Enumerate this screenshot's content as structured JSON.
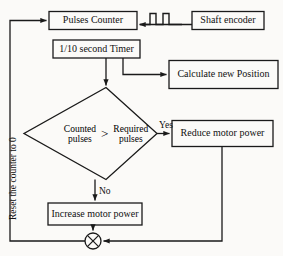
{
  "diagram": {
    "type": "flowchart",
    "stroke_color": "#1a1a1a",
    "background_color": "#fbfaf8",
    "text_color": "#111111"
  },
  "nodes": {
    "pulses_counter": {
      "label": "Pulses Counter",
      "shape": "rectangle"
    },
    "shaft_encoder": {
      "label": "Shaft encoder",
      "shape": "rectangle"
    },
    "timer": {
      "label": "1/10 second Timer",
      "shape": "rectangle"
    },
    "calculate_position": {
      "label": "Calculate new Position",
      "shape": "rectangle"
    },
    "decision": {
      "shape": "diamond",
      "left_line1": "Counted",
      "left_line2": "pulses",
      "operator": ">",
      "right_line1": "Required",
      "right_line2": "pulses"
    },
    "reduce_power": {
      "label": "Reduce motor power",
      "shape": "rectangle"
    },
    "increase_power": {
      "label": "Increase motor power",
      "shape": "rectangle"
    },
    "junction": {
      "label": "",
      "shape": "crossed-circle"
    }
  },
  "edge_labels": {
    "yes": "Yes",
    "no": "No",
    "reset": "Reset the counter to 0"
  },
  "icons": {
    "pulse_train": "pulse-waveform-icon"
  }
}
